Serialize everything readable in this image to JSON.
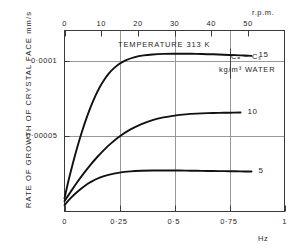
{
  "chart_data": {
    "type": "line",
    "title": "",
    "xlabel": "Hz",
    "xlabel_top": "r.p.m.",
    "ylabel": "RATE OF GROWTH OF CRYSTAL FACE mm/s",
    "xlim": [
      0,
      1
    ],
    "xlim_top": [
      0,
      60
    ],
    "ylim": [
      0,
      0.00012
    ],
    "grid": true,
    "legend_position": "right-inline",
    "x_ticks": [
      "0",
      "0·25",
      "0·5",
      "0·75",
      "1"
    ],
    "x_tick_values": [
      0,
      0.25,
      0.5,
      0.75,
      1
    ],
    "x_ticks_top": [
      "0",
      "10",
      "20",
      "30",
      "40",
      "50"
    ],
    "x_tick_values_top": [
      0,
      10,
      20,
      30,
      40,
      50
    ],
    "y_ticks": [
      "0·0001",
      "0·00005"
    ],
    "y_tick_values": [
      0.0001,
      5e-05
    ],
    "annotations": {
      "temperature": "TEMPERATURE 313 K",
      "concentration_driving_force": "Cₐ − Cₛ",
      "concentration_units": "kg/m³ WATER"
    },
    "series": [
      {
        "name": "15",
        "label": "15",
        "color": "#111111",
        "x": [
          0.0,
          0.02,
          0.04,
          0.06,
          0.08,
          0.1,
          0.12,
          0.14,
          0.16,
          0.18,
          0.2,
          0.22,
          0.25,
          0.28,
          0.32,
          0.36,
          0.4,
          0.45,
          0.5,
          0.55,
          0.6,
          0.65,
          0.7,
          0.75,
          0.8,
          0.85
        ],
        "y": [
          8.8e-06,
          2.15e-05,
          3.3e-05,
          4.36e-05,
          5.32e-05,
          6.19e-05,
          6.97e-05,
          7.65e-05,
          8.24e-05,
          8.72e-05,
          9.12e-05,
          9.44e-05,
          9.8e-05,
          0.0001004,
          0.0001024,
          0.0001035,
          0.0001041,
          0.0001045,
          0.0001046,
          0.0001046,
          0.0001045,
          0.0001043,
          0.0001041,
          0.0001038,
          0.0001035,
          0.0001032
        ]
      },
      {
        "name": "10",
        "label": "10",
        "color": "#111111",
        "x": [
          0.0,
          0.03,
          0.06,
          0.09,
          0.12,
          0.15,
          0.18,
          0.21,
          0.25,
          0.3,
          0.35,
          0.4,
          0.45,
          0.5,
          0.55,
          0.6,
          0.65,
          0.7,
          0.75,
          0.8
        ],
        "y": [
          6.8e-06,
          1.35e-05,
          1.99e-05,
          2.58e-05,
          3.13e-05,
          3.63e-05,
          4.09e-05,
          4.5e-05,
          4.97e-05,
          5.44e-05,
          5.8e-05,
          6.06e-05,
          6.24e-05,
          6.36e-05,
          6.44e-05,
          6.49e-05,
          6.52e-05,
          6.54e-05,
          6.55e-05,
          6.56e-05
        ]
      },
      {
        "name": "5",
        "label": "5",
        "color": "#111111",
        "x": [
          0.0,
          0.03,
          0.06,
          0.09,
          0.12,
          0.16,
          0.2,
          0.25,
          0.3,
          0.35,
          0.4,
          0.45,
          0.5,
          0.55,
          0.6,
          0.65,
          0.7,
          0.75,
          0.8,
          0.85
        ],
        "y": [
          4.3e-06,
          9.2e-06,
          1.33e-05,
          1.68e-05,
          1.96e-05,
          2.24e-05,
          2.43e-05,
          2.58e-05,
          2.66e-05,
          2.7e-05,
          2.72e-05,
          2.72e-05,
          2.72e-05,
          2.71e-05,
          2.7e-05,
          2.69e-05,
          2.68e-05,
          2.67e-05,
          2.66e-05,
          2.65e-05
        ]
      }
    ]
  }
}
